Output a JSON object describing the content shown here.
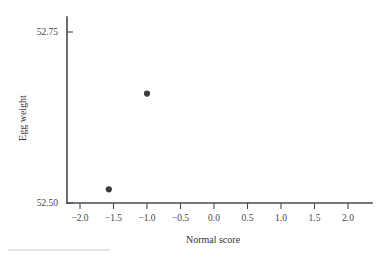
{
  "chart_data": {
    "type": "scatter",
    "title": "",
    "xlabel": "Normal score",
    "ylabel": "Egg weight",
    "xlim": [
      -2.25,
      2.25
    ],
    "ylim": [
      52.44,
      53.56
    ],
    "grid": false,
    "legend": "none",
    "xticks": [
      -2.0,
      -1.5,
      -1.0,
      -0.5,
      0.0,
      0.5,
      1.0,
      1.5,
      2.0
    ],
    "xticklabels": [
      "-2.0",
      "-1.5",
      "-1.0",
      "-0.5",
      "0.0",
      "0.5",
      "1.0",
      "1.5",
      "2.0"
    ],
    "yticks": [
      52.5,
      52.75,
      53.0,
      53.25,
      53.5
    ],
    "yticklabels": [
      "52.50",
      "52.75",
      "53.00",
      "53.25",
      "53.50"
    ],
    "marker": "filled-circle",
    "marker_color": "#3c3c3c",
    "x": [
      -1.57,
      -1.0,
      -0.66,
      -0.38,
      -0.1,
      0.15,
      0.39,
      0.66,
      1.01,
      1.58
    ],
    "y": [
      52.52,
      52.66,
      52.86,
      53.01,
      53.05,
      53.08,
      53.17,
      53.25,
      53.27,
      53.5
    ],
    "points": [
      {
        "x": -1.57,
        "y": 52.52
      },
      {
        "x": -1.0,
        "y": 52.66
      },
      {
        "x": -0.66,
        "y": 52.86
      },
      {
        "x": -0.38,
        "y": 53.01
      },
      {
        "x": -0.1,
        "y": 53.05
      },
      {
        "x": 0.15,
        "y": 53.08
      },
      {
        "x": 0.39,
        "y": 53.17
      },
      {
        "x": 0.66,
        "y": 53.25
      },
      {
        "x": 1.01,
        "y": 53.27
      },
      {
        "x": 1.58,
        "y": 53.5
      }
    ]
  },
  "colors": {
    "axis": "#4a4a4a",
    "marker": "#3c3c3c",
    "text": "#3a3a3a",
    "background": "#ffffff",
    "footer_rule": "#c9c9c9"
  }
}
